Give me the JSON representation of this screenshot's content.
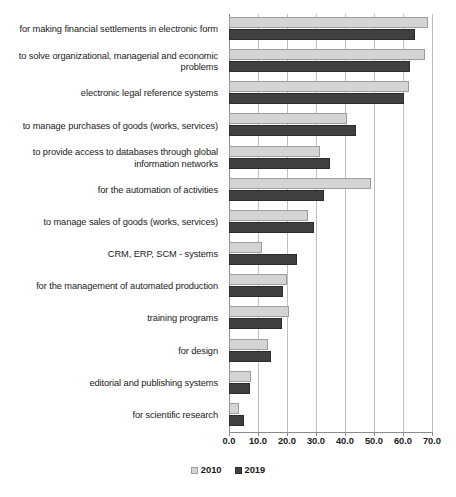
{
  "chart_data": {
    "type": "bar",
    "orientation": "horizontal",
    "title": "",
    "subtitle": "",
    "xlabel": "",
    "ylabel": "",
    "xlim": [
      0,
      70
    ],
    "xticks": [
      "0.0",
      "10.0",
      "20.0",
      "30.0",
      "40.0",
      "50.0",
      "60.0",
      "70.0"
    ],
    "xtick_values": [
      0,
      10,
      20,
      30,
      40,
      50,
      60,
      70
    ],
    "grid": true,
    "legend_position": "bottom",
    "categories": [
      "for making financial settlements in electronic form",
      "to solve organizational, managerial and economic problems",
      "electronic legal reference systems",
      "to manage purchases of goods (works, services)",
      "to provide access to databases through global information networks",
      "for the automation of activities",
      "to manage sales of goods (works, services)",
      "CRM, ERP, SCM - systems",
      "for the management of automated production",
      "training programs",
      "for design",
      "editorial and publishing systems",
      "for scientific research"
    ],
    "series": [
      {
        "name": "2010",
        "color": "#d4d4d4",
        "values": [
          68.5,
          67.5,
          62.0,
          40.6,
          31.5,
          48.8,
          27.3,
          11.4,
          20.1,
          20.8,
          13.6,
          7.5,
          3.6
        ]
      },
      {
        "name": "2019",
        "color": "#404040",
        "values": [
          64.0,
          62.5,
          60.2,
          43.8,
          34.8,
          32.8,
          29.4,
          23.4,
          18.7,
          18.4,
          14.6,
          7.1,
          5.0
        ]
      }
    ]
  },
  "legend": {
    "items": [
      {
        "label": "2010",
        "swatch": "light-gray-square"
      },
      {
        "label": "2019",
        "swatch": "dark-gray-square"
      }
    ]
  }
}
